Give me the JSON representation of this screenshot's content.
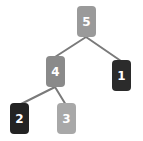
{
  "figure": {
    "type": "binary-tree-diagram",
    "background_color": "#ffffff",
    "width": 143,
    "height": 141
  },
  "edge_color": "#7a7a7a",
  "edge_width": 2,
  "label_color": "#ffffff",
  "nodes": [
    {
      "id": "5",
      "label": "5",
      "role": "root",
      "color": "#9a9a9a",
      "x": 77,
      "y": 6,
      "anchor_top_x": 86,
      "anchor_top_y": 6,
      "anchor_bottom_x": 86,
      "anchor_bottom_y": 37
    },
    {
      "id": "4",
      "label": "4",
      "role": "left-child-of-5",
      "color": "#8a8a8a",
      "x": 46,
      "y": 56,
      "anchor_top_x": 55,
      "anchor_top_y": 56,
      "anchor_bottom_x": 55,
      "anchor_bottom_y": 87
    },
    {
      "id": "1",
      "label": "1",
      "role": "right-child-of-5",
      "color": "#2b2b2b",
      "x": 112,
      "y": 60,
      "anchor_top_x": 121,
      "anchor_top_y": 60,
      "anchor_bottom_x": 121,
      "anchor_bottom_y": 91
    },
    {
      "id": "2",
      "label": "2",
      "role": "left-child-of-4",
      "color": "#232323",
      "x": 10,
      "y": 103,
      "anchor_top_x": 19,
      "anchor_top_y": 103,
      "anchor_bottom_x": 19,
      "anchor_bottom_y": 134
    },
    {
      "id": "3",
      "label": "3",
      "role": "right-child-of-4",
      "color": "#a8a8a8",
      "x": 57,
      "y": 103,
      "anchor_top_x": 66,
      "anchor_top_y": 103,
      "anchor_bottom_x": 66,
      "anchor_bottom_y": 134
    }
  ],
  "edges": [
    {
      "from": "5",
      "to": "4",
      "x1": 86,
      "y1": 37,
      "x2": 55,
      "y2": 57
    },
    {
      "from": "5",
      "to": "1",
      "x1": 86,
      "y1": 37,
      "x2": 121,
      "y2": 61
    },
    {
      "from": "4",
      "to": "2",
      "x1": 55,
      "y1": 87,
      "x2": 19,
      "y2": 105
    },
    {
      "from": "4",
      "to": "3",
      "x1": 55,
      "y1": 87,
      "x2": 66,
      "y2": 105
    }
  ]
}
